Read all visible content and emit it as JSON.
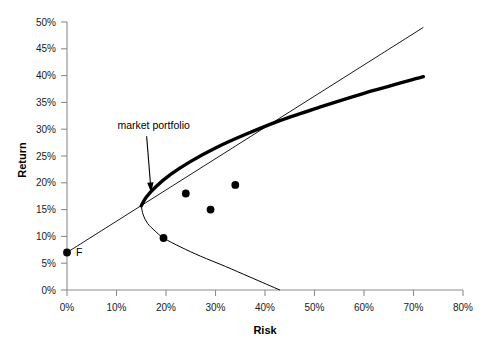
{
  "chart_data": {
    "type": "scatter",
    "title": "",
    "xlabel": "Risk",
    "ylabel": "Return",
    "xlim": [
      0,
      80
    ],
    "ylim": [
      0,
      50
    ],
    "grid": false,
    "legend": "none",
    "x_tick_labels": [
      "0%",
      "10%",
      "20%",
      "30%",
      "40%",
      "50%",
      "60%",
      "70%",
      "80%"
    ],
    "x_tick_values": [
      0,
      10,
      20,
      30,
      40,
      50,
      60,
      70,
      80
    ],
    "y_tick_labels": [
      "0%",
      "5%",
      "10%",
      "15%",
      "20%",
      "25%",
      "30%",
      "35%",
      "40%",
      "45%",
      "50%"
    ],
    "y_tick_values": [
      0,
      5,
      10,
      15,
      20,
      25,
      30,
      35,
      40,
      45,
      50
    ],
    "annotations": [
      {
        "text": "market portfolio",
        "label_x": 17.5,
        "label_y": 30.0,
        "target_x": 17.0,
        "target_y": 18.2
      },
      {
        "text": "F",
        "label_x": 1.8,
        "label_y": 6.4
      }
    ],
    "series": [
      {
        "name": "individual assets",
        "type": "scatter",
        "points": [
          {
            "x": 0.0,
            "y": 7.0
          },
          {
            "x": 19.5,
            "y": 9.7
          },
          {
            "x": 24.0,
            "y": 18.0
          },
          {
            "x": 29.0,
            "y": 15.0
          },
          {
            "x": 34.0,
            "y": 19.6
          }
        ]
      },
      {
        "name": "capital market line",
        "type": "line",
        "style": "thin",
        "points": [
          {
            "x": 0.0,
            "y": 7.0
          },
          {
            "x": 72.0,
            "y": 49.0
          }
        ]
      },
      {
        "name": "efficient frontier",
        "type": "line",
        "style": "thick",
        "points": [
          {
            "x": 15.0,
            "y": 15.7
          },
          {
            "x": 16.0,
            "y": 17.3
          },
          {
            "x": 18.0,
            "y": 19.3
          },
          {
            "x": 21.0,
            "y": 21.6
          },
          {
            "x": 25.0,
            "y": 24.0
          },
          {
            "x": 30.0,
            "y": 26.5
          },
          {
            "x": 36.0,
            "y": 29.0
          },
          {
            "x": 43.0,
            "y": 31.6
          },
          {
            "x": 51.0,
            "y": 34.1
          },
          {
            "x": 60.0,
            "y": 36.7
          },
          {
            "x": 72.0,
            "y": 39.8
          }
        ]
      },
      {
        "name": "inefficient frontier branch",
        "type": "line",
        "style": "thin",
        "points": [
          {
            "x": 15.0,
            "y": 15.7
          },
          {
            "x": 15.4,
            "y": 14.0
          },
          {
            "x": 16.3,
            "y": 12.4
          },
          {
            "x": 17.8,
            "y": 11.0
          },
          {
            "x": 19.5,
            "y": 9.7
          },
          {
            "x": 23.0,
            "y": 8.0
          },
          {
            "x": 27.0,
            "y": 6.3
          },
          {
            "x": 32.0,
            "y": 4.4
          },
          {
            "x": 37.0,
            "y": 2.4
          },
          {
            "x": 43.0,
            "y": 0.0
          }
        ]
      }
    ]
  },
  "axes": {
    "x_axis_name": "Risk",
    "y_axis_name": "Return"
  }
}
